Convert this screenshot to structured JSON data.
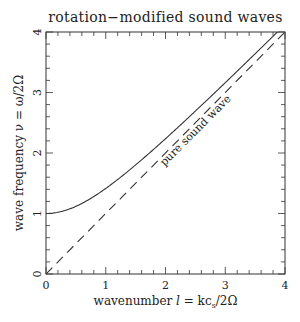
{
  "chart_data": {
    "type": "line",
    "title": "rotation−modified sound waves",
    "xlabel": "wavenumber l = kc_s/2Ω",
    "ylabel": "wave frequency ν = ω/2Ω",
    "xlim": [
      0,
      4
    ],
    "ylim": [
      0,
      4
    ],
    "x_ticks": [
      "0",
      "1",
      "2",
      "3",
      "4"
    ],
    "y_ticks": [
      "0",
      "1",
      "2",
      "3",
      "4"
    ],
    "minor_tick_step": 0.2,
    "grid": false,
    "legend": null,
    "series": [
      {
        "name": "rotation-modified sound wave",
        "style": "solid",
        "formula": "nu = sqrt(1 + l^2)",
        "x": [
          0,
          0.5,
          1,
          1.5,
          2,
          2.5,
          3,
          3.5,
          4
        ],
        "y": [
          1.0,
          1.118,
          1.414,
          1.803,
          2.236,
          2.693,
          3.162,
          3.64,
          4.123
        ]
      },
      {
        "name": "pure sound wave",
        "style": "dashed",
        "formula": "nu = l",
        "x": [
          0,
          4
        ],
        "y": [
          0,
          4
        ]
      }
    ],
    "annotations": [
      {
        "text": "pure sound wave",
        "x": 2.6,
        "y": 2.25,
        "rotation": -45
      }
    ]
  },
  "labels": {
    "title": "rotation−modified sound waves",
    "xlabel_prefix": "wavenumber ",
    "xlabel_var": "l",
    "xlabel_eq": " = kc",
    "xlabel_sub": "s",
    "xlabel_tail": "/2Ω",
    "ylabel": "wave frequency ν = ω/2Ω",
    "annotation": "pure sound wave",
    "x_ticks": [
      "0",
      "1",
      "2",
      "3",
      "4"
    ],
    "y_ticks": [
      "0",
      "1",
      "2",
      "3",
      "4"
    ]
  }
}
